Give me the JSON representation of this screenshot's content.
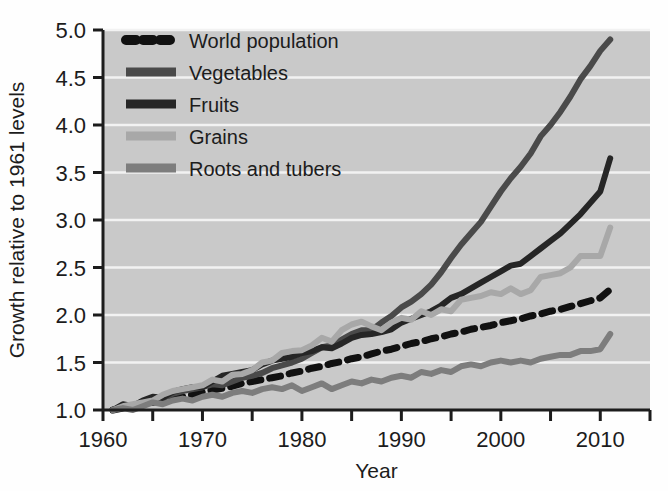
{
  "chart_data": {
    "type": "line",
    "title": "",
    "xlabel": "Year",
    "ylabel": "Growth relative to 1961 levels",
    "xlim": [
      1960,
      2015
    ],
    "ylim": [
      1.0,
      5.0
    ],
    "grid": true,
    "grid_orientation": "horizontal",
    "legend_position": "top-left-inside",
    "plot_background": "#c9c9c9",
    "gridline_color": "#f2f2f2",
    "x_ticks": [
      1960,
      1970,
      1980,
      1990,
      2000,
      2010
    ],
    "x_tick_labels": [
      "1960",
      "1970",
      "1980",
      "1990",
      "2000",
      "2010"
    ],
    "x_minor_ticks": [
      1965,
      1975,
      1985,
      1995,
      2005,
      2015
    ],
    "y_ticks": [
      1.0,
      1.5,
      2.0,
      2.5,
      3.0,
      3.5,
      4.0,
      4.5,
      5.0
    ],
    "y_tick_labels": [
      "1.0",
      "1.5",
      "2.0",
      "2.5",
      "3.0",
      "3.5",
      "4.0",
      "4.5",
      "5.0"
    ],
    "x": [
      1961,
      1962,
      1963,
      1964,
      1965,
      1966,
      1967,
      1968,
      1969,
      1970,
      1971,
      1972,
      1973,
      1974,
      1975,
      1976,
      1977,
      1978,
      1979,
      1980,
      1981,
      1982,
      1983,
      1984,
      1985,
      1986,
      1987,
      1988,
      1989,
      1990,
      1991,
      1992,
      1993,
      1994,
      1995,
      1996,
      1997,
      1998,
      1999,
      2000,
      2001,
      2002,
      2003,
      2004,
      2005,
      2006,
      2007,
      2008,
      2009,
      2010,
      2011
    ],
    "series": [
      {
        "name": "World population",
        "color": "#111111",
        "style": "dashed",
        "width": 7,
        "legend_marker": "dashed",
        "values": [
          1.0,
          1.02,
          1.04,
          1.06,
          1.08,
          1.1,
          1.12,
          1.14,
          1.16,
          1.19,
          1.21,
          1.23,
          1.25,
          1.28,
          1.3,
          1.32,
          1.34,
          1.36,
          1.39,
          1.41,
          1.44,
          1.46,
          1.49,
          1.51,
          1.54,
          1.56,
          1.59,
          1.62,
          1.64,
          1.67,
          1.7,
          1.72,
          1.75,
          1.77,
          1.8,
          1.82,
          1.85,
          1.87,
          1.89,
          1.92,
          1.94,
          1.96,
          1.99,
          2.01,
          2.04,
          2.06,
          2.09,
          2.12,
          2.15,
          2.18,
          2.27
        ]
      },
      {
        "name": "Vegetables",
        "color": "#4a4a4a",
        "style": "solid",
        "width": 6,
        "legend_marker": "solid",
        "values": [
          1.0,
          1.04,
          1.03,
          1.08,
          1.11,
          1.12,
          1.17,
          1.2,
          1.22,
          1.24,
          1.27,
          1.26,
          1.3,
          1.34,
          1.36,
          1.39,
          1.44,
          1.47,
          1.5,
          1.54,
          1.6,
          1.66,
          1.68,
          1.74,
          1.8,
          1.84,
          1.84,
          1.92,
          1.99,
          2.08,
          2.14,
          2.22,
          2.32,
          2.45,
          2.6,
          2.74,
          2.86,
          2.98,
          3.14,
          3.3,
          3.44,
          3.56,
          3.7,
          3.88,
          4.0,
          4.14,
          4.3,
          4.48,
          4.62,
          4.78,
          4.9
        ]
      },
      {
        "name": "Fruits",
        "color": "#262626",
        "style": "solid",
        "width": 6,
        "legend_marker": "solid",
        "values": [
          1.0,
          1.06,
          1.04,
          1.1,
          1.14,
          1.13,
          1.19,
          1.22,
          1.24,
          1.24,
          1.3,
          1.36,
          1.38,
          1.4,
          1.42,
          1.48,
          1.52,
          1.54,
          1.56,
          1.6,
          1.62,
          1.66,
          1.65,
          1.7,
          1.76,
          1.79,
          1.8,
          1.82,
          1.85,
          1.92,
          1.96,
          2.0,
          2.04,
          2.1,
          2.18,
          2.22,
          2.28,
          2.34,
          2.4,
          2.46,
          2.52,
          2.54,
          2.62,
          2.7,
          2.78,
          2.86,
          2.96,
          3.06,
          3.18,
          3.3,
          3.65
        ]
      },
      {
        "name": "Grains",
        "color": "#a8a8a8",
        "style": "solid",
        "width": 6,
        "legend_marker": "solid",
        "values": [
          1.0,
          1.04,
          1.06,
          1.08,
          1.1,
          1.16,
          1.2,
          1.22,
          1.24,
          1.26,
          1.32,
          1.3,
          1.37,
          1.38,
          1.42,
          1.5,
          1.52,
          1.6,
          1.62,
          1.63,
          1.68,
          1.76,
          1.72,
          1.84,
          1.9,
          1.93,
          1.88,
          1.84,
          1.92,
          1.97,
          1.95,
          2.04,
          2.0,
          2.06,
          2.04,
          2.16,
          2.18,
          2.2,
          2.24,
          2.22,
          2.28,
          2.22,
          2.26,
          2.4,
          2.42,
          2.44,
          2.5,
          2.62,
          2.62,
          2.62,
          2.92
        ]
      },
      {
        "name": "Roots and tubers",
        "color": "#7d7d7d",
        "style": "solid",
        "width": 6,
        "legend_marker": "solid",
        "values": [
          1.0,
          1.02,
          1.0,
          1.04,
          1.08,
          1.06,
          1.1,
          1.12,
          1.1,
          1.14,
          1.16,
          1.14,
          1.18,
          1.2,
          1.18,
          1.22,
          1.24,
          1.22,
          1.26,
          1.2,
          1.24,
          1.28,
          1.22,
          1.26,
          1.3,
          1.28,
          1.32,
          1.3,
          1.34,
          1.36,
          1.34,
          1.4,
          1.38,
          1.42,
          1.4,
          1.46,
          1.48,
          1.46,
          1.5,
          1.52,
          1.5,
          1.52,
          1.5,
          1.54,
          1.56,
          1.58,
          1.58,
          1.62,
          1.62,
          1.64,
          1.8
        ]
      }
    ]
  },
  "legend": {
    "entries": [
      {
        "label": "World population"
      },
      {
        "label": "Vegetables"
      },
      {
        "label": "Fruits"
      },
      {
        "label": "Grains"
      },
      {
        "label": "Roots and tubers"
      }
    ]
  }
}
